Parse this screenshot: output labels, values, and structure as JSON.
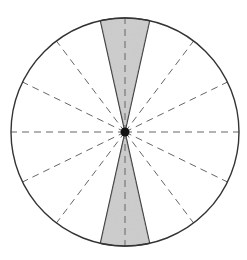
{
  "diagram": {
    "type": "circle-sector-diagram",
    "canvas": {
      "width": 247,
      "height": 260,
      "background": "#ffffff"
    },
    "circle": {
      "cx": 125,
      "cy": 132,
      "r": 114,
      "stroke": "#333333",
      "stroke_width": 1.4
    },
    "center_dot": {
      "r": 4.5,
      "fill": "#111111"
    },
    "shaded_wedges": {
      "fill": "#cfcfcf",
      "stroke": "#333333",
      "half_angle_deg": 12.5,
      "directions_deg": [
        90,
        270
      ]
    },
    "dashed_spokes": {
      "stroke": "#666666",
      "dash": "7,5",
      "angles_deg": [
        0,
        26,
        53,
        90,
        127,
        154,
        180,
        206,
        233,
        270,
        307,
        334
      ]
    },
    "labels": []
  }
}
